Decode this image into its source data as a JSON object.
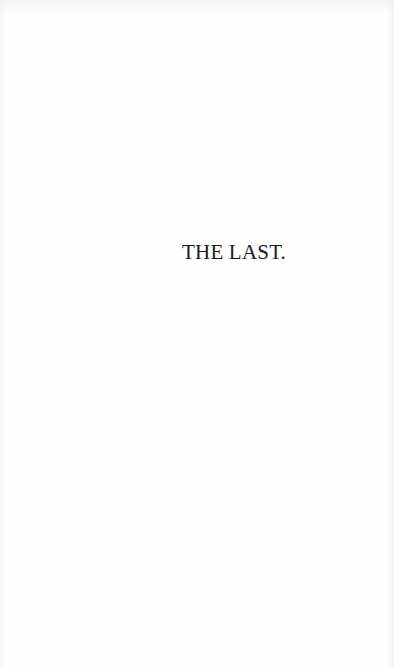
{
  "page": {
    "title": "THE LAST."
  },
  "colors": {
    "background": "#fefefe",
    "text": "#1a1a1a"
  }
}
